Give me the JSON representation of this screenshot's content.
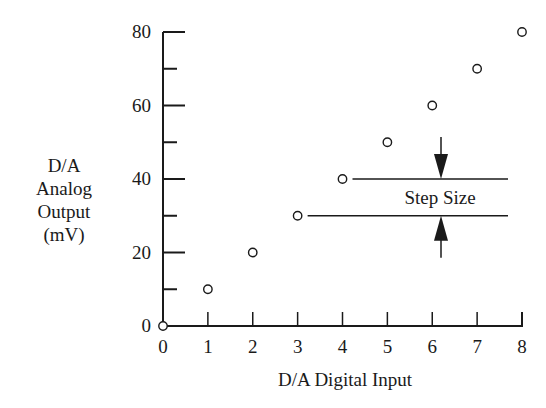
{
  "chart_data": {
    "type": "scatter",
    "title": "",
    "xlabel": "D/A Digital Input",
    "ylabel": [
      "D/A",
      "Analog",
      "Output",
      "(mV)"
    ],
    "x": [
      0,
      1,
      2,
      3,
      4,
      5,
      6,
      7,
      8
    ],
    "y": [
      0,
      10,
      20,
      30,
      40,
      50,
      60,
      70,
      80
    ],
    "xlim": [
      0,
      8
    ],
    "ylim": [
      0,
      80
    ],
    "x_ticks": [
      "0",
      "1",
      "2",
      "3",
      "4",
      "5",
      "6",
      "7",
      "8"
    ],
    "y_ticks": [
      "0",
      "20",
      "40",
      "60",
      "80"
    ],
    "y_minor_ticks": [
      10,
      30,
      50,
      70
    ],
    "grid": false,
    "legend": null,
    "marker": "open-circle",
    "annotations": [
      {
        "text": "Step Size",
        "from_y": 30,
        "to_y": 40,
        "description": "Horizontal reference lines at 30 and 40 mV with inward-pointing arrows marking the step size"
      }
    ]
  }
}
